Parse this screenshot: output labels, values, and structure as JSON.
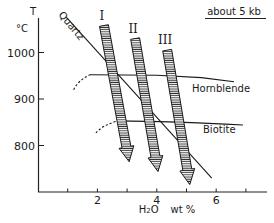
{
  "chart_data": {
    "type": "line",
    "title": "about 5 kb",
    "xlabel": "H2O  wt %",
    "ylabel": "T",
    "yunit": "°C",
    "xlim": [
      0,
      7.6
    ],
    "ylim": [
      690,
      1085
    ],
    "x_ticks": [
      1,
      2,
      3,
      4,
      5,
      6,
      7
    ],
    "x_tick_labels": [
      {
        "value": 2,
        "label": "2"
      },
      {
        "value": 4,
        "label": "4"
      },
      {
        "value": 6,
        "label": "6"
      }
    ],
    "y_ticks": [
      {
        "value": 1000,
        "label": "1000"
      },
      {
        "value": 900,
        "label": "900"
      },
      {
        "value": 800,
        "label": "800"
      }
    ],
    "grid": false,
    "series": [
      {
        "name": "Quartz",
        "style": "solid",
        "points": [
          [
            0.95,
            1076
          ],
          [
            5.85,
            730
          ]
        ]
      },
      {
        "name": "Hornblende",
        "style": "solid",
        "points": [
          [
            1.75,
            952
          ],
          [
            4.0,
            951
          ],
          [
            5.5,
            946
          ],
          [
            6.6,
            937
          ]
        ]
      },
      {
        "name": "Hornblende (dashed extension)",
        "style": "dashed",
        "points": [
          [
            1.2,
            920
          ],
          [
            1.35,
            940
          ],
          [
            1.75,
            952
          ]
        ]
      },
      {
        "name": "Biotite",
        "style": "solid",
        "points": [
          [
            2.7,
            853
          ],
          [
            4.5,
            852
          ],
          [
            6.9,
            844
          ]
        ]
      },
      {
        "name": "Biotite (dashed extension)",
        "style": "dashed",
        "points": [
          [
            1.95,
            827
          ],
          [
            2.2,
            845
          ],
          [
            2.7,
            853
          ]
        ]
      }
    ],
    "arrows": [
      {
        "label": "I",
        "from": [
          2.22,
          1058
        ],
        "to": [
          3.07,
          765
        ]
      },
      {
        "label": "II",
        "from": [
          3.27,
          1030
        ],
        "to": [
          4.04,
          744
        ]
      },
      {
        "label": "III",
        "from": [
          4.35,
          1005
        ],
        "to": [
          5.11,
          716
        ]
      }
    ],
    "annotations": [
      {
        "text": "Quartz",
        "anchor": "upper-left along line"
      },
      {
        "text": "Hornblende",
        "anchor": "below right end of Hornblende curve"
      },
      {
        "text": "Biotite",
        "anchor": "below right end of Biotite curve"
      },
      {
        "text": "about 5 kb",
        "anchor": "top-right, underlined"
      }
    ]
  }
}
